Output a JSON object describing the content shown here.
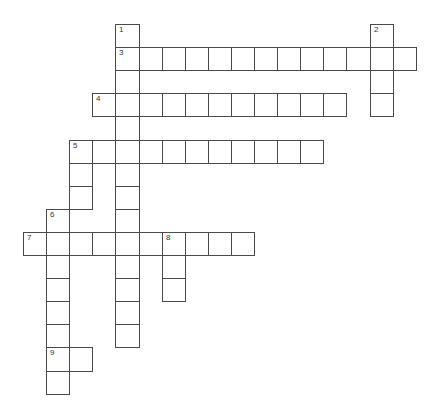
{
  "puzzle": {
    "type": "crossword",
    "cell_size": 23.1,
    "origin": {
      "x": 23,
      "y": 24
    },
    "grid_border_color": "#4a4a4a",
    "entries": [
      {
        "number": "1",
        "direction": "down",
        "row": 0,
        "col": 4,
        "length": 14
      },
      {
        "number": "2",
        "direction": "down",
        "row": 0,
        "col": 15,
        "length": 4
      },
      {
        "number": "3",
        "direction": "across",
        "row": 1,
        "col": 4,
        "length": 13
      },
      {
        "number": "4",
        "direction": "across",
        "row": 3,
        "col": 3,
        "length": 11
      },
      {
        "number": "5",
        "direction": "across",
        "row": 5,
        "col": 2,
        "length": 11
      },
      {
        "number": "5",
        "direction": "down",
        "row": 5,
        "col": 2,
        "length": 3
      },
      {
        "number": "6",
        "direction": "down",
        "row": 8,
        "col": 1,
        "length": 8
      },
      {
        "number": "7",
        "direction": "across",
        "row": 9,
        "col": 0,
        "length": 10
      },
      {
        "number": "8",
        "direction": "down",
        "row": 9,
        "col": 6,
        "length": 3
      },
      {
        "number": "9",
        "direction": "across",
        "row": 14,
        "col": 1,
        "length": 2
      }
    ]
  }
}
